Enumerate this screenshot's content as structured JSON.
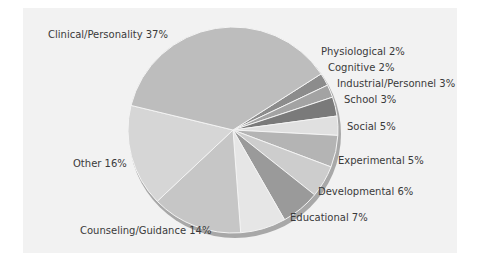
{
  "chart_data": {
    "type": "pie",
    "title": "",
    "start_angle_deg_from_top_clockwise": 57,
    "direction": "clockwise",
    "categories": [
      "Physiological",
      "Cognitive",
      "Industrial/Personnel",
      "School",
      "Social",
      "Experimental",
      "Developmental",
      "Educational",
      "Counseling/Guidance",
      "Other",
      "Clinical/Personality"
    ],
    "values": [
      2,
      2,
      3,
      3,
      5,
      5,
      6,
      7,
      14,
      16,
      37
    ],
    "unit": "%",
    "colors": [
      "#8c8c8c",
      "#a3a3a3",
      "#7a7a7a",
      "#e0e0e0",
      "#b4b4b4",
      "#cdcdcd",
      "#9a9a9a",
      "#e6e6e6",
      "#c6c6c6",
      "#d6d6d6",
      "#bdbdbd"
    ],
    "legend": "none (labels placed beside slices)"
  },
  "labels": [
    {
      "text": "Clinical/Personality 37%",
      "x": 48,
      "y": 37
    },
    {
      "text": "Physiological 2%",
      "x": 321,
      "y": 54
    },
    {
      "text": "Cognitive 2%",
      "x": 328,
      "y": 70
    },
    {
      "text": "Industrial/Personnel 3%",
      "x": 337,
      "y": 86
    },
    {
      "text": "School 3%",
      "x": 344,
      "y": 102
    },
    {
      "text": "Social 5%",
      "x": 347,
      "y": 129
    },
    {
      "text": "Experimental 5%",
      "x": 338,
      "y": 163
    },
    {
      "text": "Developmental 6%",
      "x": 318,
      "y": 194
    },
    {
      "text": "Educational 7%",
      "x": 290,
      "y": 220
    },
    {
      "text": "Counseling/Guidance 14%",
      "x": 80,
      "y": 233
    },
    {
      "text": "Other 16%",
      "x": 73,
      "y": 166
    }
  ]
}
